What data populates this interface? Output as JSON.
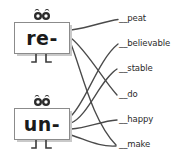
{
  "worksheet": {
    "title": "Prefix matching worksheet",
    "instructionless": true,
    "ink_color": "#4a4a4a",
    "text_color": "#2b2b2b",
    "card_border_color": "#8b8b8b",
    "card_shadow_color": "#c9c9c9",
    "background_color": "#ffffff"
  },
  "prefixes": [
    {
      "id": "re",
      "label": "re-",
      "ornament": "eyes-icon",
      "legs": "legs-icon"
    },
    {
      "id": "un",
      "label": "un-",
      "ornament": "eyes-icon",
      "legs": "legs-icon"
    }
  ],
  "words": [
    {
      "id": "peat",
      "label": "__peat",
      "y": 18
    },
    {
      "id": "believable",
      "label": "__believable",
      "y": 43
    },
    {
      "id": "stable",
      "label": "__stable",
      "y": 68
    },
    {
      "id": "do",
      "label": "__do",
      "y": 94
    },
    {
      "id": "happy",
      "label": "__happy",
      "y": 119
    },
    {
      "id": "make",
      "label": "__make",
      "y": 144
    }
  ],
  "connections": [
    {
      "from": "re",
      "to": "peat"
    },
    {
      "from": "re",
      "to": "do"
    },
    {
      "from": "re",
      "to": "make"
    },
    {
      "from": "un",
      "to": "believable"
    },
    {
      "from": "un",
      "to": "stable"
    },
    {
      "from": "un",
      "to": "happy"
    },
    {
      "from": "un",
      "to": "make"
    }
  ]
}
